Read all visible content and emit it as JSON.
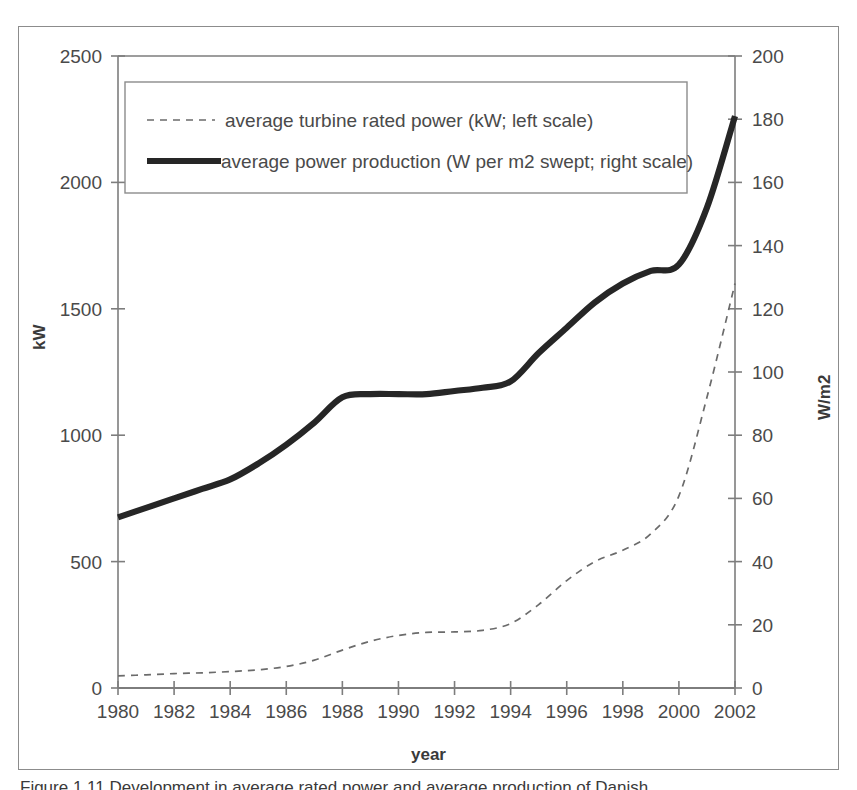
{
  "figure": {
    "caption": "Figure 1.11  Development in average rated power and average production of Danish",
    "frame_color": "#8c8c8c"
  },
  "axes": {
    "x_title": "year",
    "y_left_title": "kW",
    "y_right_title": "W/m2",
    "x_ticks": [
      "1980",
      "1982",
      "1984",
      "1986",
      "1988",
      "1990",
      "1992",
      "1994",
      "1996",
      "1998",
      "2000",
      "2002"
    ],
    "y_left_ticks": [
      "0",
      "500",
      "1000",
      "1500",
      "2000",
      "2500"
    ],
    "y_right_ticks": [
      "0",
      "20",
      "40",
      "60",
      "80",
      "100",
      "120",
      "140",
      "160",
      "180",
      "200"
    ]
  },
  "legend": {
    "items": [
      {
        "label": "average turbine rated power (kW; left scale)",
        "style": "dashed"
      },
      {
        "label": "average power production (W per m2 swept; right scale)",
        "style": "solid-thick"
      }
    ]
  },
  "chart_data": {
    "type": "line",
    "title": "",
    "xlabel": "year",
    "ylabel": "kW",
    "ylabel_right": "W/m2",
    "xlim": [
      1980,
      2002
    ],
    "ylim_left": [
      0,
      2500
    ],
    "ylim_right": [
      0,
      200
    ],
    "grid": false,
    "legend_position": "top-left-inside",
    "x": [
      1980,
      1981,
      1982,
      1983,
      1984,
      1985,
      1986,
      1987,
      1988,
      1989,
      1990,
      1991,
      1992,
      1993,
      1994,
      1995,
      1996,
      1997,
      1998,
      1999,
      2000,
      2001,
      2002
    ],
    "series": [
      {
        "name": "average turbine rated power (kW; left scale)",
        "axis": "left",
        "unit": "kW",
        "style": "dashed",
        "values": [
          48,
          52,
          57,
          60,
          65,
          72,
          85,
          110,
          150,
          185,
          208,
          220,
          222,
          228,
          255,
          330,
          425,
          500,
          545,
          610,
          760,
          1150,
          1600
        ]
      },
      {
        "name": "average power production (W per m2 swept; right scale)",
        "axis": "right",
        "unit": "W/m2",
        "style": "solid-thick",
        "values": [
          54,
          57,
          60,
          63,
          66,
          71,
          77,
          84,
          92,
          93,
          93,
          93,
          94,
          95,
          97,
          106,
          114,
          122,
          128,
          132,
          134,
          152,
          181
        ]
      }
    ]
  }
}
